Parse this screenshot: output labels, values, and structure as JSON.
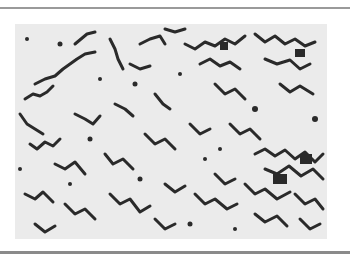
{
  "figure": {
    "colors": {
      "background": "#ebebeb",
      "cells": "#2a2a2a",
      "frame_rule": "#9a9a9a"
    }
  }
}
